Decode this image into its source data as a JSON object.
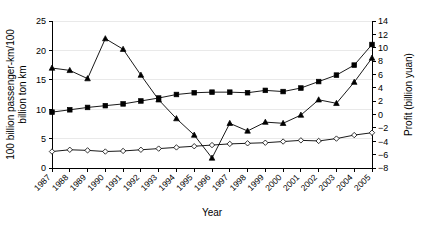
{
  "chart_data": {
    "type": "line",
    "title": "",
    "xlabel": "Year",
    "ylabel": "100 billion passenger-km/100 billion ton km",
    "y2label": "Profit (billion yuan)",
    "categories": [
      "1987",
      "1988",
      "1989",
      "1990",
      "1991",
      "1992",
      "1993",
      "1994",
      "1995",
      "1996",
      "1997",
      "1998",
      "1999",
      "2000",
      "2001",
      "2002",
      "2003",
      "2004",
      "2005"
    ],
    "ylim": [
      0,
      25
    ],
    "yticks": [
      0,
      5,
      10,
      15,
      20,
      25
    ],
    "y2lim": [
      -8,
      14
    ],
    "y2ticks": [
      -8,
      -6,
      -4,
      -2,
      0,
      2,
      4,
      6,
      8,
      10,
      12,
      14
    ],
    "grid": true,
    "legend": "none",
    "series": [
      {
        "name": "profit",
        "marker": "triangle",
        "axis": "right",
        "values_left_scale": [
          17.0,
          16.6,
          15.2,
          22.0,
          20.2,
          15.8,
          11.6,
          8.4,
          5.6,
          1.7,
          7.6,
          6.3,
          7.8,
          7.6,
          9.0,
          11.6,
          11.0,
          14.6,
          18.7
        ],
        "values": [
          6.9,
          6.3,
          4.4,
          12.5,
          10.0,
          4.2,
          -1.0,
          -4.1,
          -6.4,
          -8.0,
          -3.0,
          -4.5,
          -2.2,
          -2.5,
          -1.0,
          2.2,
          1.3,
          5.5,
          11.1
        ]
      },
      {
        "name": "passenger-km",
        "marker": "square",
        "axis": "left",
        "values": [
          9.5,
          9.9,
          10.3,
          10.6,
          10.9,
          11.4,
          11.9,
          12.5,
          12.8,
          12.9,
          12.9,
          12.8,
          13.2,
          13.0,
          13.6,
          14.7,
          15.8,
          17.5,
          21.0
        ]
      },
      {
        "name": "ton-km",
        "marker": "diamond",
        "axis": "left",
        "values": [
          2.8,
          3.1,
          3.0,
          2.8,
          2.9,
          3.1,
          3.3,
          3.5,
          3.7,
          3.9,
          4.1,
          4.2,
          4.3,
          4.5,
          4.7,
          4.6,
          5.0,
          5.6,
          6.0
        ]
      }
    ]
  }
}
